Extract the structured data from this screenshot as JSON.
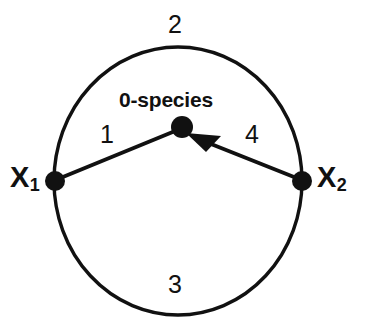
{
  "figure": {
    "colors": {
      "background": "#ffffff",
      "stroke": "#111111",
      "node_fill": "#111111",
      "text": "#111111"
    },
    "geometry": {
      "circle": {
        "cx": 178,
        "cy": 181,
        "rx": 124,
        "ry": 134
      },
      "stroke_width": 3.4,
      "node_radius": 10,
      "center_node_radius": 11
    }
  },
  "nodes": [
    {
      "id": "x1",
      "label": "X",
      "sub": "1",
      "x": 55,
      "y": 181,
      "kind": "boundary-node"
    },
    {
      "id": "x2",
      "label": "X",
      "sub": "2",
      "x": 302,
      "y": 181,
      "kind": "boundary-node"
    },
    {
      "id": "center",
      "label": "0-species",
      "sub": "",
      "x": 182,
      "y": 127,
      "kind": "center-node"
    }
  ],
  "edges": [
    {
      "id": "edge-1",
      "label": "1",
      "from": "x1",
      "to": "center",
      "style": "chord",
      "arrow": false
    },
    {
      "id": "edge-4",
      "label": "4",
      "from": "x2",
      "to": "center",
      "style": "chord",
      "arrow": true
    },
    {
      "id": "arc-2",
      "label": "2",
      "from": "x1",
      "to": "x2",
      "style": "arc-upper",
      "arrow": false
    },
    {
      "id": "arc-3",
      "label": "3",
      "from": "x1",
      "to": "x2",
      "style": "arc-lower",
      "arrow": false
    }
  ],
  "labels": {
    "top": "2",
    "bottom": "3",
    "left_chord": "1",
    "right_chord": "4",
    "center": "0-species",
    "node_left_base": "X",
    "node_left_sub": "1",
    "node_right_base": "X",
    "node_right_sub": "2"
  }
}
